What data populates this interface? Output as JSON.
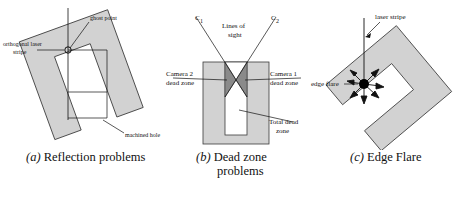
{
  "figure": {
    "panels": [
      {
        "id": "a",
        "caption_marker": "(a)",
        "caption_text": "Reflection problems",
        "labels": {
          "ghost_point": "ghost point",
          "orthogonal_laser_stripe_line1": "orthogonal laser",
          "orthogonal_laser_stripe_line2": "stripe",
          "machined_hole": "machined hole"
        }
      },
      {
        "id": "b",
        "caption_marker": "(b)",
        "caption_text": "Dead zone",
        "caption_text2": "problems",
        "labels": {
          "camera_left": "C",
          "camera_left_sub": "1",
          "camera_right": "C",
          "camera_right_sub": "2",
          "lines_of_sight_line1": "Lines of",
          "lines_of_sight_line2": "sight",
          "camera2_dead_zone_line1": "Camera 2",
          "camera2_dead_zone_line2": "dead zone",
          "camera1_dead_zone_line1": "Camera 1",
          "camera1_dead_zone_line2": "dead zone",
          "total_dead_zone_line1": "Total dead",
          "total_dead_zone_line2": "zone"
        }
      },
      {
        "id": "c",
        "caption_marker": "(c)",
        "caption_text": "Edge Flare",
        "labels": {
          "laser_stripe": "laser stripe",
          "edge_flare": "edge flare"
        }
      }
    ],
    "colors": {
      "block_fill": "#d2d2d2",
      "dead_zone_fill": "#8a8a8a",
      "line": "#111111",
      "slot_fill": "#ffffff",
      "flare_dot": "#000000",
      "background": "#ffffff"
    }
  }
}
